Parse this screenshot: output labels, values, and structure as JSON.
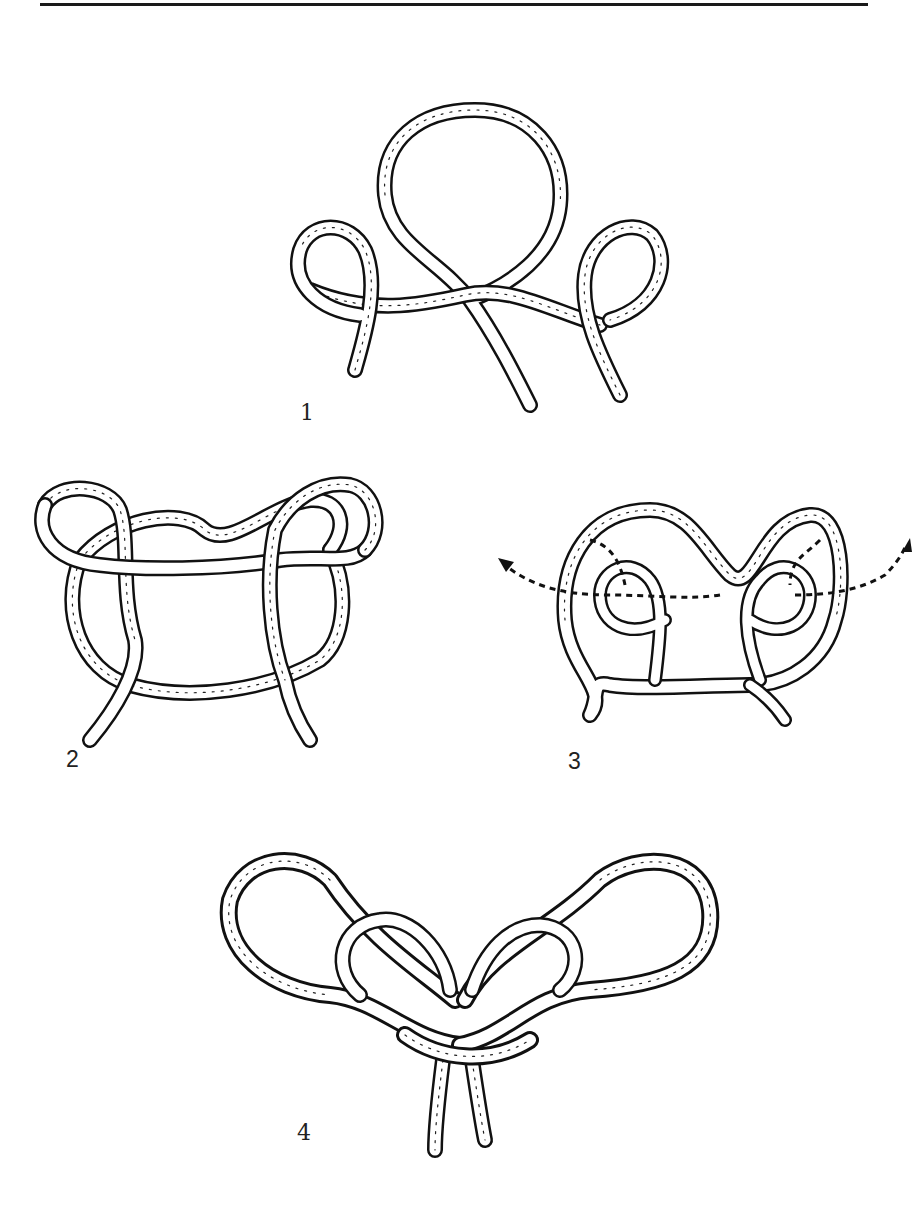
{
  "page": {
    "top_rule": true
  },
  "figures": [
    {
      "id": 1,
      "label": "1",
      "description": "Rope with large center overhand loop and two small side loops"
    },
    {
      "id": 2,
      "label": "2",
      "description": "Side loops folded over center loop forming interlaced frame"
    },
    {
      "id": 3,
      "label": "3",
      "description": "Figure-eight loops with dashed arrows showing pull-through direction"
    },
    {
      "id": 4,
      "label": "4",
      "description": "Finished knot with two large bow loops and two hanging ends"
    }
  ],
  "arrows": {
    "figure3": {
      "style": "dashed",
      "directions": [
        "left",
        "right"
      ]
    }
  },
  "colors": {
    "ink": "#111111",
    "rope_fill": "#ffffff",
    "background": "#ffffff"
  }
}
